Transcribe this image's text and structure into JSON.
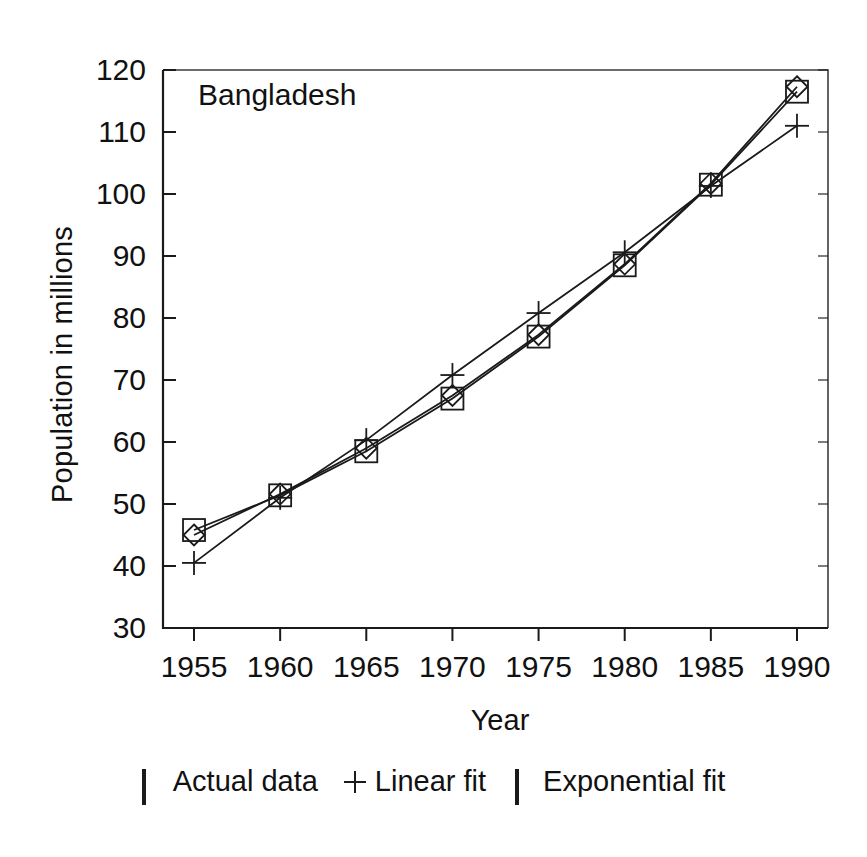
{
  "chart_data": {
    "type": "line",
    "title": "Bangladesh",
    "xlabel": "Year",
    "ylabel": "Population in millions",
    "x": [
      1955,
      1960,
      1965,
      1970,
      1975,
      1980,
      1985,
      1990
    ],
    "xticklabels": [
      "1955",
      "1960",
      "1965",
      "1970",
      "1975",
      "1980",
      "1985",
      "1990"
    ],
    "yticklabels": [
      "30",
      "40",
      "50",
      "60",
      "70",
      "80",
      "90",
      "100",
      "110",
      "120"
    ],
    "yticks": [
      30,
      40,
      50,
      60,
      70,
      80,
      90,
      100,
      110,
      120
    ],
    "xlim": [
      1953.2,
      1991.8
    ],
    "ylim": [
      30,
      120
    ],
    "grid": false,
    "legend_position": "below-axes",
    "series": [
      {
        "name": "Actual data",
        "marker": "square",
        "values": [
          45.8,
          51.4,
          58.5,
          67.0,
          77.0,
          88.5,
          101.5,
          116.5
        ]
      },
      {
        "name": "Linear fit",
        "marker": "plus",
        "values": [
          40.5,
          51.0,
          60.3,
          70.8,
          80.8,
          90.6,
          101.3,
          111.0
        ]
      },
      {
        "name": "Exponential fit",
        "marker": "diamond",
        "values": [
          45.0,
          51.6,
          59.0,
          67.5,
          77.3,
          88.7,
          101.7,
          117.3
        ]
      }
    ]
  },
  "legend": {
    "items": [
      {
        "label": "Actual data",
        "marker": "square"
      },
      {
        "label": "Linear fit",
        "marker": "plus"
      },
      {
        "label": "Exponential fit",
        "marker": "diamond"
      }
    ]
  },
  "colors": {
    "ink": "#1a1a1a",
    "background": "#ffffff"
  }
}
